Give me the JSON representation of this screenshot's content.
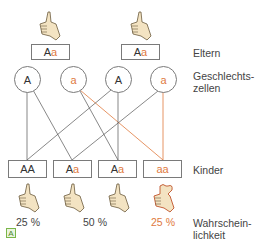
{
  "labels": {
    "parents": "Eltern",
    "gametes_line1": "Geschlechts-",
    "gametes_line2": "zellen",
    "children": "Kinder",
    "probability_line1": "Wahrschein-",
    "probability_line2": "lichkeit"
  },
  "parents": [
    {
      "allele1": "A",
      "allele2": "a",
      "phenotype": "thumb-straight"
    },
    {
      "allele1": "A",
      "allele2": "a",
      "phenotype": "thumb-straight"
    }
  ],
  "gametes": [
    {
      "allele": "A",
      "type": "dominant"
    },
    {
      "allele": "a",
      "type": "recessive"
    },
    {
      "allele": "A",
      "type": "dominant"
    },
    {
      "allele": "a",
      "type": "recessive"
    }
  ],
  "children": [
    {
      "allele1": "A",
      "allele2": "A",
      "phenotype": "thumb-straight"
    },
    {
      "allele1": "A",
      "allele2": "a",
      "phenotype": "thumb-straight"
    },
    {
      "allele1": "A",
      "allele2": "a",
      "phenotype": "thumb-straight"
    },
    {
      "allele1": "a",
      "allele2": "a",
      "phenotype": "thumb-hitchhiker"
    }
  ],
  "probabilities": [
    {
      "value": "25 %",
      "type": "dominant"
    },
    {
      "value": "50 %",
      "type": "dominant"
    },
    {
      "value": "25 %",
      "type": "recessive"
    }
  ],
  "badge": "A",
  "colors": {
    "recessive": "#e07a3e",
    "line": "#555555",
    "box_border": "#7a7a7a",
    "badge_border": "#7ab648"
  }
}
